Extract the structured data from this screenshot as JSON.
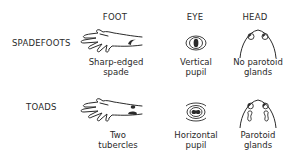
{
  "columns": [
    {
      "id": "foot",
      "label": "FOOT"
    },
    {
      "id": "eye",
      "label": "EYE"
    },
    {
      "id": "head",
      "label": "HEAD"
    }
  ],
  "rows": [
    {
      "label": "SPADEFOOTS",
      "foot": {
        "icon": "foot-with-spade-icon",
        "caption_line1": "Sharp-edged",
        "caption_line2": "spade"
      },
      "eye": {
        "icon": "eye-vertical-pupil-icon",
        "caption_line1": "Vertical",
        "caption_line2": "pupil"
      },
      "head": {
        "icon": "head-no-parotoid-icon",
        "caption_line1": "No parotoid",
        "caption_line2": "glands"
      }
    },
    {
      "label": "TOADS",
      "foot": {
        "icon": "foot-with-two-tubercles-icon",
        "caption_line1": "Two",
        "caption_line2": "tubercles"
      },
      "eye": {
        "icon": "eye-horizontal-pupil-icon",
        "caption_line1": "Horizontal",
        "caption_line2": "pupil"
      },
      "head": {
        "icon": "head-parotoid-glands-icon",
        "caption_line1": "Parotoid",
        "caption_line2": "glands"
      }
    }
  ],
  "colors": {
    "ink": "#2a2a2a",
    "background": "#ffffff"
  }
}
